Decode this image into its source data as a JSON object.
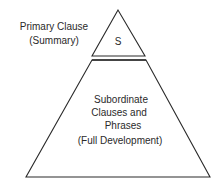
{
  "diagram": {
    "type": "pyramid",
    "top_section": {
      "side_label_line1": "Primary Clause",
      "side_label_line2": "(Summary)",
      "inner_label": "S"
    },
    "bottom_section": {
      "line1": "Subordinate",
      "line2": "Clauses and",
      "line3": "Phrases",
      "line4": "(Full Development)"
    },
    "colors": {
      "stroke": "#2a2a2a",
      "background": "#ffffff"
    }
  }
}
